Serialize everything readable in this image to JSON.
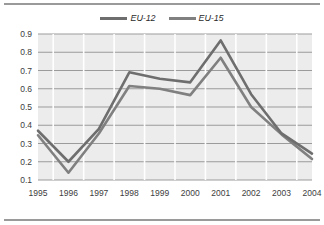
{
  "chart_data": {
    "type": "line",
    "title": "",
    "subtitle": "",
    "xlabel": "",
    "ylabel": "",
    "categories": [
      "1995",
      "1996",
      "1997",
      "1998",
      "1999",
      "2000",
      "2001",
      "2002",
      "2003",
      "2004"
    ],
    "series": [
      {
        "name": "EU-12",
        "color": "#6e6e6e",
        "values": [
          0.37,
          0.2,
          0.38,
          0.69,
          0.655,
          0.635,
          0.865,
          0.57,
          0.355,
          0.245
        ]
      },
      {
        "name": "EU-15",
        "color": "#808080",
        "values": [
          0.345,
          0.14,
          0.355,
          0.615,
          0.6,
          0.565,
          0.77,
          0.5,
          0.35,
          0.215
        ]
      }
    ],
    "ylim": [
      0.1,
      0.9
    ],
    "yticks": [
      0.9,
      0.8,
      0.7,
      0.6,
      0.5,
      0.4,
      0.3,
      0.2,
      0.1
    ],
    "ytick_labels": [
      "0.9",
      "0.8",
      "0.7",
      "0.6",
      "0.5",
      "0.4",
      "0.3",
      "0.2",
      "0.1"
    ],
    "grid": true,
    "grid_color": "#9b9b9b",
    "legend_position": "top-center",
    "plot_background": "#ececec",
    "figure_background": "#ffffff"
  },
  "legend": {
    "items": [
      {
        "label": "EU-12"
      },
      {
        "label": "EU-15"
      }
    ]
  }
}
